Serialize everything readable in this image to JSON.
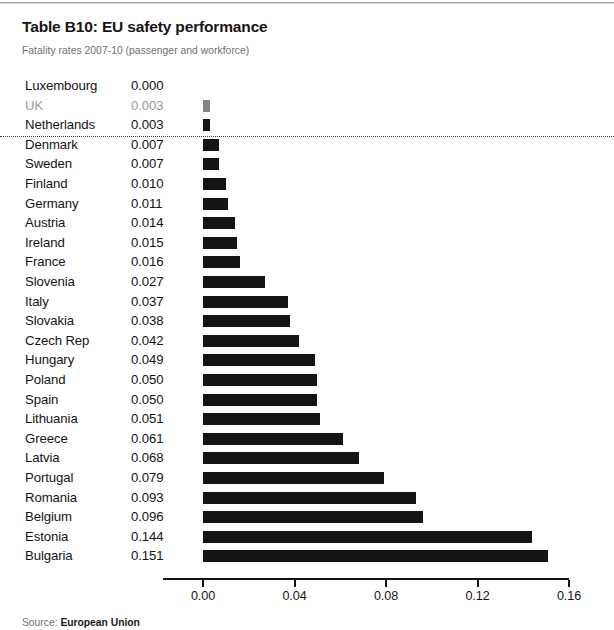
{
  "header": {
    "title": "Table B10: EU safety performance",
    "subtitle": "Fatality rates 2007-10 (passenger and workforce)"
  },
  "footer": {
    "source_label": "Source:",
    "source_name": "European Union"
  },
  "colors": {
    "bar": "#141414",
    "bar_highlight": "#858585",
    "text": "#141414",
    "muted_text": "#9b9b9b",
    "subtitle_text": "#6f6f6f",
    "axis": "#141414",
    "divider": "#3a3a3a"
  },
  "chart_data": {
    "type": "bar",
    "orientation": "horizontal",
    "title": "Table B10: EU safety performance",
    "subtitle": "Fatality rates 2007-10 (passenger and workforce)",
    "xlabel": "",
    "ylabel": "",
    "xlim": [
      0,
      0.16
    ],
    "grid": false,
    "legend": null,
    "xticks": [
      "0.00",
      "0.04",
      "0.08",
      "0.12",
      "0.16"
    ],
    "xtick_values": [
      0.0,
      0.04,
      0.08,
      0.12,
      0.16
    ],
    "value_format": "0.000",
    "highlight_category": "UK",
    "divider_after_index": 2,
    "categories": [
      "Luxembourg",
      "UK",
      "Netherlands",
      "Denmark",
      "Sweden",
      "Finland",
      "Germany",
      "Austria",
      "Ireland",
      "France",
      "Slovenia",
      "Italy",
      "Slovakia",
      "Czech Rep",
      "Hungary",
      "Poland",
      "Spain",
      "Lithuania",
      "Greece",
      "Latvia",
      "Portugal",
      "Romania",
      "Belgium",
      "Estonia",
      "Bulgaria"
    ],
    "values": [
      0.0,
      0.003,
      0.003,
      0.007,
      0.007,
      0.01,
      0.011,
      0.014,
      0.015,
      0.016,
      0.027,
      0.037,
      0.038,
      0.042,
      0.049,
      0.05,
      0.05,
      0.051,
      0.061,
      0.068,
      0.079,
      0.093,
      0.096,
      0.144,
      0.151
    ],
    "value_labels": [
      "0.000",
      "0.003",
      "0.003",
      "0.007",
      "0.007",
      "0.010",
      "0.011",
      "0.014",
      "0.015",
      "0.016",
      "0.027",
      "0.037",
      "0.038",
      "0.042",
      "0.049",
      "0.050",
      "0.050",
      "0.051",
      "0.061",
      "0.068",
      "0.079",
      "0.093",
      "0.096",
      "0.144",
      "0.151"
    ]
  }
}
